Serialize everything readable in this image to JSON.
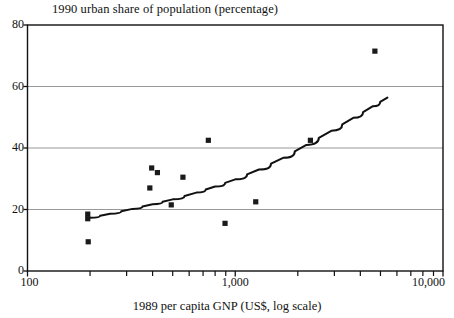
{
  "chart_data": {
    "type": "scatter",
    "title": "1990 urban share of population (percentage)",
    "xlabel": "1989 per capita GNP (US$, log scale)",
    "ylabel": "1990 urban share of population (percentage)",
    "xscale": "log",
    "xlim": [
      100,
      10000
    ],
    "ylim": [
      0,
      80
    ],
    "grid": "horizontal",
    "legend": "none",
    "xticks_major": [
      {
        "value": 100,
        "label": "100"
      },
      {
        "value": 1000,
        "label": "1,000"
      },
      {
        "value": 10000,
        "label": "10,000"
      }
    ],
    "xticks_minor": [
      200,
      300,
      400,
      500,
      600,
      700,
      800,
      900,
      2000,
      3000,
      4000,
      5000,
      6000,
      7000,
      8000,
      9000
    ],
    "yticks": [
      0,
      20,
      40,
      60,
      80
    ],
    "ytick_labels": [
      "0",
      "20",
      "40",
      "60",
      "80"
    ],
    "gridlines_y": [
      20,
      40,
      60
    ],
    "series": [
      {
        "name": "countries",
        "marker": "square",
        "marker_color": "#1a1a1a",
        "points": [
          {
            "x": 195,
            "y": 18.5
          },
          {
            "x": 195,
            "y": 17.0
          },
          {
            "x": 196,
            "y": 9.5
          },
          {
            "x": 388,
            "y": 27.0
          },
          {
            "x": 396,
            "y": 33.5
          },
          {
            "x": 422,
            "y": 32.0
          },
          {
            "x": 492,
            "y": 21.5
          },
          {
            "x": 560,
            "y": 30.5
          },
          {
            "x": 742,
            "y": 42.5
          },
          {
            "x": 893,
            "y": 15.5
          },
          {
            "x": 1255,
            "y": 22.5
          },
          {
            "x": 2300,
            "y": 42.5
          },
          {
            "x": 4700,
            "y": 71.5
          }
        ]
      },
      {
        "name": "fitted trend line",
        "type": "line",
        "line_color": "#111111",
        "points": [
          {
            "x": 200,
            "y": 17.3
          },
          {
            "x": 250,
            "y": 18.6
          },
          {
            "x": 320,
            "y": 20.2
          },
          {
            "x": 400,
            "y": 21.7
          },
          {
            "x": 500,
            "y": 23.3
          },
          {
            "x": 650,
            "y": 25.5
          },
          {
            "x": 800,
            "y": 27.5
          },
          {
            "x": 1000,
            "y": 29.8
          },
          {
            "x": 1300,
            "y": 33.0
          },
          {
            "x": 1700,
            "y": 36.8
          },
          {
            "x": 2200,
            "y": 41.0
          },
          {
            "x": 2900,
            "y": 45.6
          },
          {
            "x": 3700,
            "y": 49.8
          },
          {
            "x": 4600,
            "y": 53.6
          },
          {
            "x": 5400,
            "y": 56.4
          }
        ]
      }
    ]
  },
  "axes": {
    "frame_color": "#111111",
    "grid_color": "#8c8c8c"
  }
}
